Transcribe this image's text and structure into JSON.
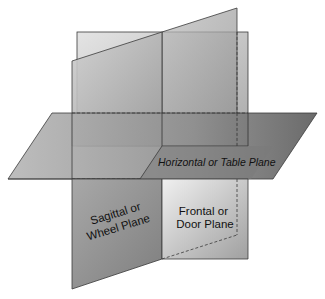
{
  "diagram": {
    "type": "anatomical-planes",
    "planes": [
      {
        "id": "horizontal",
        "label": "Horizontal or Table Plane",
        "style": "italic"
      },
      {
        "id": "sagittal",
        "label_line1": "Sagittal or",
        "label_line2": "Wheel Plane"
      },
      {
        "id": "frontal",
        "label_line1": "Frontal or",
        "label_line2": "Door Plane"
      }
    ],
    "colors": {
      "edge": "#3a3a3a",
      "plane_light": "#d8d8d8",
      "plane_mid": "#a9a9a9",
      "plane_dark": "#6e6e6e"
    }
  }
}
